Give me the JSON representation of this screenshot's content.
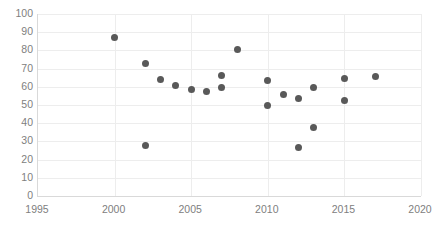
{
  "chart_data": {
    "type": "scatter",
    "title": "",
    "xlabel": "",
    "ylabel": "",
    "xlim": [
      1995,
      2020
    ],
    "ylim": [
      0,
      100
    ],
    "xticks": [
      1995,
      2000,
      2005,
      2010,
      2015,
      2020
    ],
    "yticks": [
      0,
      10,
      20,
      30,
      40,
      50,
      60,
      70,
      80,
      90,
      100
    ],
    "grid": "horizontal-and-vertical",
    "legend": "none",
    "marker_color": "#595959",
    "gridline_color": "#ededed",
    "axis_color": "#d9d9d9",
    "tick_label_color": "#808080",
    "series": [
      {
        "name": "series1",
        "points": [
          {
            "x": 2000,
            "y": 87
          },
          {
            "x": 2002,
            "y": 73
          },
          {
            "x": 2002,
            "y": 28
          },
          {
            "x": 2003,
            "y": 64
          },
          {
            "x": 2004,
            "y": 60.5
          },
          {
            "x": 2005,
            "y": 58.5
          },
          {
            "x": 2006,
            "y": 57.5
          },
          {
            "x": 2007,
            "y": 66
          },
          {
            "x": 2007,
            "y": 59.5
          },
          {
            "x": 2008,
            "y": 80.5
          },
          {
            "x": 2010,
            "y": 63.5
          },
          {
            "x": 2010,
            "y": 49.5
          },
          {
            "x": 2011,
            "y": 55.5
          },
          {
            "x": 2012,
            "y": 53.5
          },
          {
            "x": 2012,
            "y": 26.5
          },
          {
            "x": 2013,
            "y": 59.5
          },
          {
            "x": 2013,
            "y": 37.5
          },
          {
            "x": 2015,
            "y": 64.5
          },
          {
            "x": 2015,
            "y": 52.5
          },
          {
            "x": 2017,
            "y": 65.5
          }
        ]
      }
    ]
  }
}
